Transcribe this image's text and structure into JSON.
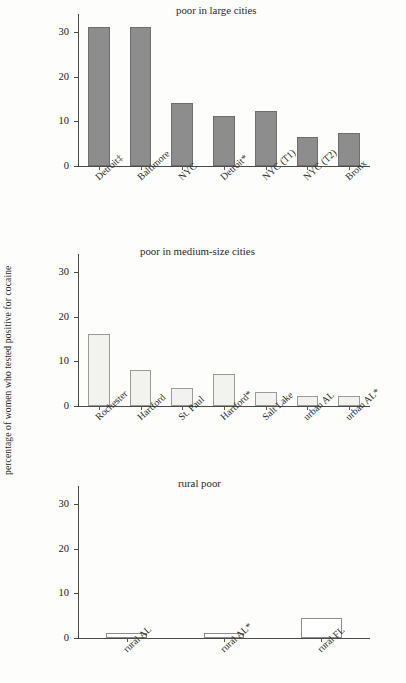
{
  "figure": {
    "ylabel": "percentage of women who tested positive for cocaine",
    "yticks": [
      "0",
      "10",
      "20",
      "30"
    ],
    "background": "#fdfdfb",
    "axis_color": "#4a4a4a"
  },
  "chart_data": [
    {
      "type": "bar",
      "title": "poor in large cities",
      "categories": [
        "Detroit‡",
        "Baltimore",
        "NYC",
        "Detroit*",
        "NYC (T1)",
        "NYC (T2)",
        "Bronx"
      ],
      "values": [
        31.0,
        31.0,
        14.2,
        11.2,
        12.3,
        6.5,
        7.4
      ],
      "xlabel": "",
      "ylabel": "percentage of women who tested positive for cocaine",
      "ylim": [
        0,
        34
      ],
      "yticks": [
        0,
        10,
        20,
        30
      ],
      "grid": false,
      "legend": "none",
      "bar_fill": "#8d8d8d",
      "bar_edge": "#6f6f6f"
    },
    {
      "type": "bar",
      "title": "poor in medium-size cities",
      "categories": [
        "Rochester",
        "Hartford",
        "St. Paul",
        "Hartford*",
        "Salt Lake",
        "urban AL",
        "urban AL*"
      ],
      "values": [
        16.0,
        8.1,
        4.1,
        7.2,
        3.1,
        2.2,
        2.2
      ],
      "xlabel": "",
      "ylabel": "percentage of women who tested positive for cocaine",
      "ylim": [
        0,
        34
      ],
      "yticks": [
        0,
        10,
        20,
        30
      ],
      "grid": false,
      "legend": "none",
      "bar_fill": "#f2f2ef",
      "bar_edge": "#9a9a9a"
    },
    {
      "type": "bar",
      "title": "rural poor",
      "categories": [
        "rural AL",
        "rural AL*",
        "rural FL"
      ],
      "values": [
        1.1,
        1.1,
        4.5
      ],
      "xlabel": "",
      "ylabel": "percentage of women who tested positive for cocaine",
      "ylim": [
        0,
        34
      ],
      "yticks": [
        0,
        10,
        20,
        30
      ],
      "grid": false,
      "legend": "none",
      "bar_fill": "#ffffff",
      "bar_edge": "#8d8d8d"
    }
  ]
}
